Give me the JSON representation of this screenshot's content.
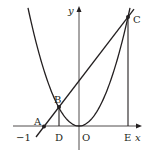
{
  "diagram": {
    "axes": {
      "x_label": "x",
      "y_label": "y",
      "origin_label": "O",
      "tick_label": "−1"
    },
    "points": {
      "A": "A",
      "B": "B",
      "C": "C",
      "D": "D",
      "E": "E"
    },
    "math": {
      "parabola_coeff": 1,
      "line_through_x": -1,
      "B_x": -0.5,
      "C_x": 1.2
    },
    "colors": {
      "ink": "#231f20",
      "axis": "#231f20"
    }
  }
}
